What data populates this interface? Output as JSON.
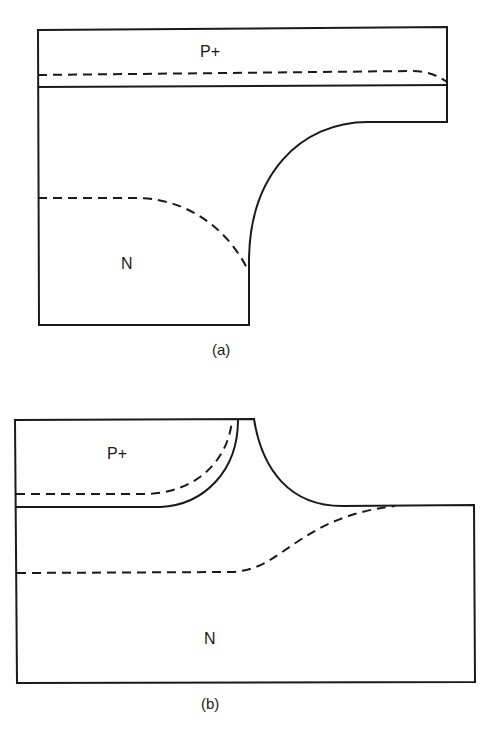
{
  "figure_a": {
    "caption": "(a)",
    "region_top_label": "P+",
    "region_bottom_label": "N"
  },
  "figure_b": {
    "caption": "(b)",
    "region_top_label": "P+",
    "region_bottom_label": "N"
  },
  "colors": {
    "line": "#1a1a1a",
    "background": "#ffffff"
  }
}
